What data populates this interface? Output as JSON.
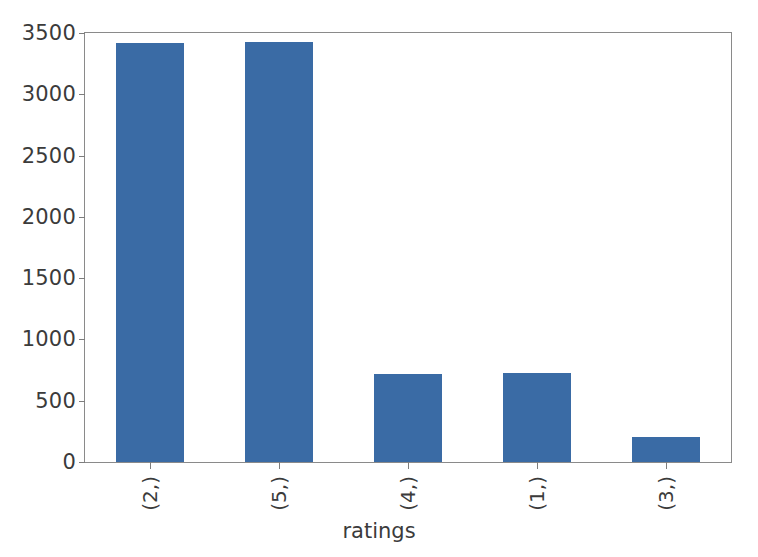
{
  "chart_data": {
    "type": "bar",
    "title": "",
    "xlabel": "ratings",
    "ylabel": "",
    "categories": [
      "(2,)",
      "(5,)",
      "(4,)",
      "(1,)",
      "(3,)"
    ],
    "values": [
      3418,
      3426,
      716,
      724,
      203
    ],
    "ylim": [
      0,
      3500
    ],
    "yticks": [
      0,
      500,
      1000,
      1500,
      2000,
      2500,
      3000,
      3500
    ],
    "ytick_labels": [
      "0",
      "500",
      "1000",
      "1500",
      "2000",
      "2500",
      "3000",
      "3500"
    ],
    "grid": false,
    "legend": null,
    "bar_color": "#3a6ba5",
    "axes_color": "#8a8a8a",
    "background": "#ffffff",
    "xtick_rotation": 90
  }
}
